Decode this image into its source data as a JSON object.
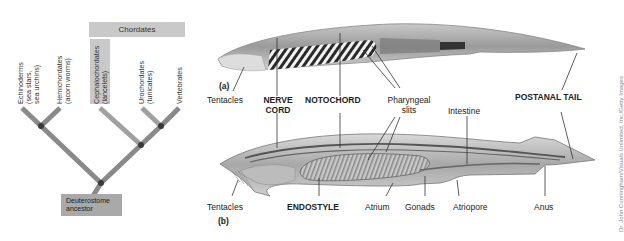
{
  "cladogram": {
    "group_label": "Chordates",
    "taxa": [
      {
        "name": "Echinoderms",
        "detail": [
          "(sea stars,",
          "sea urchins)"
        ]
      },
      {
        "name": "Hemichordates",
        "detail": [
          "(acorn worms)"
        ]
      },
      {
        "name": "Cephalochordates",
        "detail": [
          "(lancelets)"
        ],
        "highlighted": true
      },
      {
        "name": "Urochordates",
        "detail": [
          "(tunicates)"
        ]
      },
      {
        "name": "Vertebrates",
        "detail": []
      }
    ],
    "root_label": [
      "Deuterostome",
      "ancestor"
    ],
    "colors": {
      "branch": "#8a8a8a",
      "node": "#3a3a3a",
      "group_box": "#c9c9c9",
      "root_box": "#a9a9a9"
    }
  },
  "panel_a": {
    "tag": "(a)",
    "labels": {
      "tentacles": "Tentacles",
      "nerve_cord_1": "NERVE",
      "nerve_cord_2": "CORD",
      "notochord": "NOTOCHORD",
      "pharyngeal_1": "Pharyngeal",
      "pharyngeal_2": "slits",
      "postanal_tail": "POSTANAL TAIL"
    }
  },
  "panel_b": {
    "tag": "(b)",
    "labels": {
      "tentacles": "Tentacles",
      "endostyle": "ENDOSTYLE",
      "atrium": "Atrium",
      "gonads": "Gonads",
      "atriopore": "Atriopore",
      "intestine": "Intestine",
      "anus": "Anus"
    }
  },
  "credit": "Dr. John Cunningham/Visuals Unlimited, Inc./Getty Images"
}
